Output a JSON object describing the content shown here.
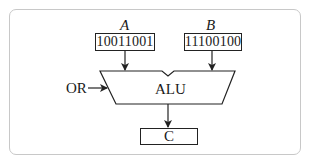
{
  "diagram": {
    "type": "alu-operation",
    "inputs": [
      {
        "name": "A",
        "value": "10011001"
      },
      {
        "name": "B",
        "value": "11100100"
      }
    ],
    "operation": "OR",
    "unit_label": "ALU",
    "output": {
      "name": "C"
    }
  },
  "colors": {
    "stroke": "#222222",
    "frame": "#c8c8c8",
    "background": "#ffffff"
  }
}
